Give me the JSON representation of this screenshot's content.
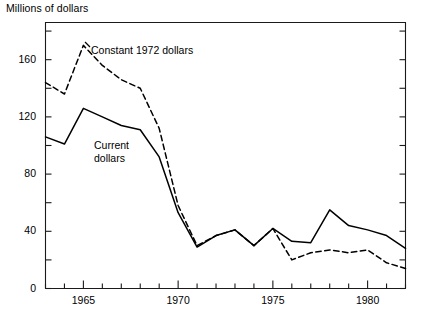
{
  "chart": {
    "axis_title_y": "Millions of dollars",
    "labels": {
      "constant": "Constant 1972 dollars",
      "current_line1": "Current",
      "current_line2": "dollars"
    },
    "y_ticks": [
      {
        "value": 0,
        "label": "0"
      },
      {
        "value": 20,
        "label": ""
      },
      {
        "value": 40,
        "label": "40"
      },
      {
        "value": 60,
        "label": ""
      },
      {
        "value": 80,
        "label": "80"
      },
      {
        "value": 100,
        "label": ""
      },
      {
        "value": 120,
        "label": "120"
      },
      {
        "value": 140,
        "label": ""
      },
      {
        "value": 160,
        "label": "160"
      },
      {
        "value": 180,
        "label": ""
      }
    ],
    "x_ticks": [
      {
        "value": 1963,
        "label": ""
      },
      {
        "value": 1964,
        "label": ""
      },
      {
        "value": 1965,
        "label": "1965"
      },
      {
        "value": 1966,
        "label": ""
      },
      {
        "value": 1967,
        "label": ""
      },
      {
        "value": 1968,
        "label": ""
      },
      {
        "value": 1969,
        "label": ""
      },
      {
        "value": 1970,
        "label": "1970"
      },
      {
        "value": 1971,
        "label": ""
      },
      {
        "value": 1972,
        "label": ""
      },
      {
        "value": 1973,
        "label": ""
      },
      {
        "value": 1974,
        "label": ""
      },
      {
        "value": 1975,
        "label": "1975"
      },
      {
        "value": 1976,
        "label": ""
      },
      {
        "value": 1977,
        "label": ""
      },
      {
        "value": 1978,
        "label": ""
      },
      {
        "value": 1979,
        "label": ""
      },
      {
        "value": 1980,
        "label": "1980"
      },
      {
        "value": 1981,
        "label": ""
      },
      {
        "value": 1982,
        "label": ""
      }
    ]
  },
  "chart_data": {
    "type": "line",
    "title": "",
    "subtitle": "",
    "xlabel": "",
    "ylabel": "Millions of dollars",
    "xlim": [
      1963,
      1982
    ],
    "ylim": [
      0,
      186
    ],
    "grid": false,
    "legend": "inline-annotations",
    "x": [
      1963,
      1964,
      1965,
      1966,
      1967,
      1968,
      1969,
      1970,
      1971,
      1972,
      1973,
      1974,
      1975,
      1976,
      1977,
      1978,
      1979,
      1980,
      1981,
      1982
    ],
    "series": [
      {
        "name": "Constant 1972 dollars",
        "style": "dashed",
        "color": "#000000",
        "values": [
          144,
          136,
          170,
          156,
          146,
          140,
          112,
          58,
          30,
          37,
          41,
          30,
          42,
          20,
          25,
          27,
          25,
          27,
          18,
          14
        ]
      },
      {
        "name": "Current dollars",
        "style": "solid",
        "color": "#000000",
        "values": [
          106,
          101,
          126,
          120,
          114,
          111,
          92,
          53,
          29,
          37,
          41,
          30,
          42,
          33,
          32,
          55,
          44,
          41,
          37,
          28
        ]
      }
    ],
    "annotations": [
      {
        "text": "Constant 1972 dollars",
        "x": 1965.8,
        "y": 158
      },
      {
        "text": "Current dollars",
        "x": 1966.0,
        "y": 100
      }
    ]
  }
}
